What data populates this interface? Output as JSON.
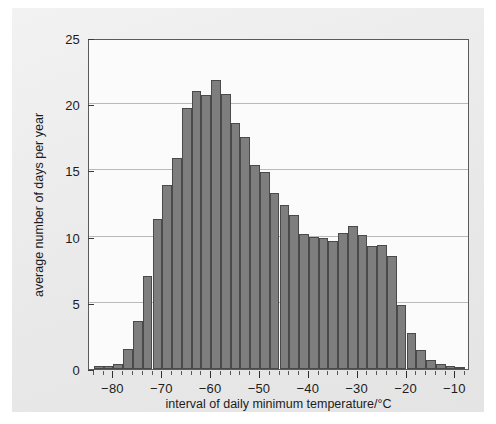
{
  "chart_data": {
    "type": "bar",
    "title": "",
    "subtitle": "",
    "xlabel": "interval of daily minimum temperature/°C",
    "ylabel": "average number of days per year",
    "xlim": [
      -85,
      -7
    ],
    "ylim": [
      0,
      25
    ],
    "grid": true,
    "legend": null,
    "bin_width": 2,
    "bar_color": "#7e7e7e",
    "bar_edge_color": "#4a4a4a",
    "plot_background": "#fbfbfb",
    "figure_background": "#ededed",
    "x_ticks": [
      {
        "value": -80,
        "label": "−80"
      },
      {
        "value": -70,
        "label": "−70"
      },
      {
        "value": -60,
        "label": "−60"
      },
      {
        "value": -50,
        "label": "−50"
      },
      {
        "value": -40,
        "label": "−40"
      },
      {
        "value": -30,
        "label": "−30"
      },
      {
        "value": -20,
        "label": "−20"
      },
      {
        "value": -10,
        "label": "−10"
      }
    ],
    "x_minor_tick_step": 2,
    "y_ticks": [
      {
        "value": 0,
        "label": "0"
      },
      {
        "value": 5,
        "label": "5"
      },
      {
        "value": 10,
        "label": "10"
      },
      {
        "value": 15,
        "label": "15"
      },
      {
        "value": 20,
        "label": "20"
      },
      {
        "value": 25,
        "label": "25"
      }
    ],
    "categories": [
      "−84",
      "−82",
      "−80",
      "−78",
      "−76",
      "−74",
      "−72",
      "−70",
      "−68",
      "−66",
      "−64",
      "−62",
      "−60",
      "−58",
      "−56",
      "−54",
      "−52",
      "−50",
      "−48",
      "−46",
      "−44",
      "−42",
      "−40",
      "−38",
      "−36",
      "−34",
      "−32",
      "−30",
      "−28",
      "−26",
      "−24",
      "−22",
      "−20",
      "−18",
      "−16",
      "−14",
      "−12",
      "−10"
    ],
    "bin_left_edges": [
      -84,
      -82,
      -80,
      -78,
      -76,
      -74,
      -72,
      -70,
      -68,
      -66,
      -64,
      -62,
      -60,
      -58,
      -56,
      -54,
      -52,
      -50,
      -48,
      -46,
      -44,
      -42,
      -40,
      -38,
      -36,
      -34,
      -32,
      -30,
      -28,
      -26,
      -24,
      -22,
      -20,
      -18,
      -16,
      -14,
      -12,
      -10
    ],
    "values": [
      0.2,
      0.2,
      0.4,
      1.5,
      3.6,
      7.0,
      11.3,
      13.9,
      15.9,
      19.7,
      21.0,
      20.7,
      21.8,
      20.8,
      18.6,
      17.5,
      15.4,
      14.9,
      13.3,
      12.4,
      11.6,
      10.2,
      10.0,
      9.9,
      9.7,
      10.3,
      10.8,
      10.1,
      9.3,
      9.4,
      8.5,
      4.8,
      2.7,
      1.4,
      0.7,
      0.35,
      0.2,
      0.1
    ]
  }
}
